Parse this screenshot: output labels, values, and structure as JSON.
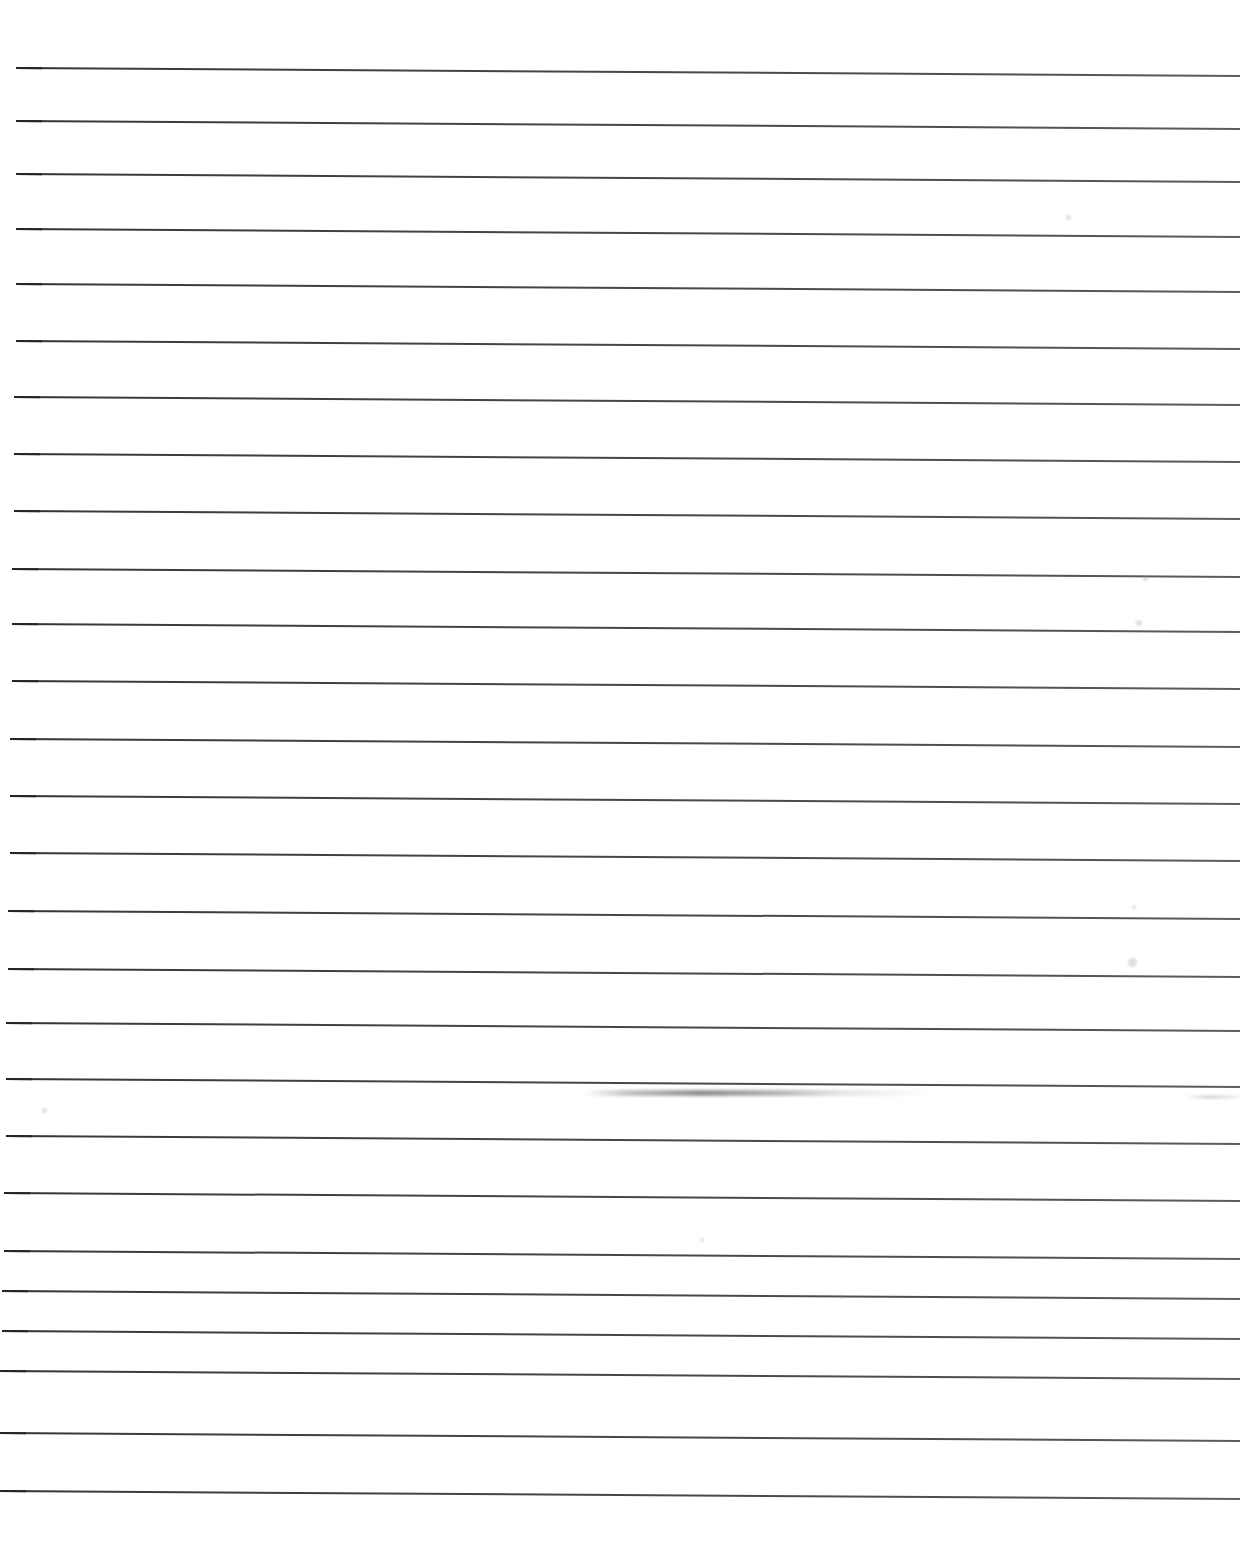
{
  "document": {
    "kind": "scanned-ruled-paper",
    "title": "Blank ruled notebook page",
    "page_width": 1240,
    "page_height": 1543,
    "background_color": "#ffffff",
    "rule_color": "#3f3f3f",
    "text_content": "",
    "has_handwriting": false,
    "has_printed_text": false,
    "margin_rule": false,
    "rule_start_x": 16,
    "rule_end_x": 1240,
    "skew_degrees": 0.38
  },
  "rules": {
    "count": 27,
    "thickness_px": 2,
    "left_x": [
      16,
      16,
      16,
      16,
      16,
      16,
      14,
      14,
      14,
      12,
      12,
      12,
      10,
      10,
      10,
      8,
      8,
      6,
      6,
      6,
      4,
      4,
      2,
      2,
      0,
      0,
      0
    ],
    "y_left": [
      67,
      120,
      173,
      228,
      283,
      340,
      396,
      453,
      510,
      568,
      623,
      680,
      738,
      795,
      852,
      910,
      968,
      1022,
      1078,
      1135,
      1192,
      1250,
      1290,
      1330,
      1370,
      1432,
      1490
    ],
    "y_right_offset": 8
  },
  "artifacts": {
    "smudge": {
      "label": "scanner-smear",
      "x": 585,
      "y": 1090,
      "width": 345,
      "height": 6
    },
    "smudge_tail": {
      "label": "scanner-smear-tail",
      "x": 1185,
      "y": 1095,
      "width": 55,
      "height": 4
    },
    "specks": [
      {
        "label": "dust-speck",
        "x": 1128,
        "y": 958,
        "size": 9
      },
      {
        "label": "dust-speck",
        "x": 1136,
        "y": 620,
        "size": 6
      },
      {
        "label": "dust-speck",
        "x": 1143,
        "y": 576,
        "size": 5
      },
      {
        "label": "dust-speck",
        "x": 1066,
        "y": 215,
        "size": 5
      },
      {
        "label": "dust-speck",
        "x": 1132,
        "y": 905,
        "size": 4
      },
      {
        "label": "dust-speck",
        "x": 42,
        "y": 1108,
        "size": 5
      },
      {
        "label": "dust-speck",
        "x": 700,
        "y": 1238,
        "size": 4
      },
      {
        "label": "dust-speck",
        "x": 840,
        "y": 1295,
        "size": 4
      }
    ]
  }
}
